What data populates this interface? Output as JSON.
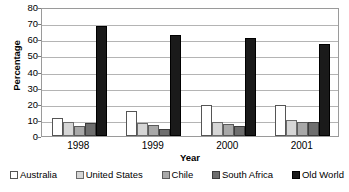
{
  "chart_data": {
    "type": "bar",
    "title": "",
    "subtitle": "",
    "xlabel": "Year",
    "ylabel": "Percentage",
    "categories": [
      "1998",
      "1999",
      "2000",
      "2001"
    ],
    "series": [
      {
        "name": "Australia",
        "color": "#ffffff",
        "values": [
          11,
          15.5,
          19,
          19.5
        ]
      },
      {
        "name": "United States",
        "color": "#d6d6d6",
        "values": [
          8.5,
          8,
          9,
          10
        ]
      },
      {
        "name": "Chile",
        "color": "#a8a8a8",
        "values": [
          6,
          7,
          7.5,
          9
        ]
      },
      {
        "name": "South Africa",
        "color": "#6e6e6e",
        "values": [
          8,
          4.5,
          6.5,
          8.5
        ]
      },
      {
        "name": "Old World",
        "color": "#1a1a1a",
        "values": [
          68,
          62.5,
          61,
          57
        ]
      }
    ],
    "ylim": [
      0,
      80
    ],
    "ytick_values": [
      0,
      10,
      20,
      30,
      40,
      50,
      60,
      70,
      80
    ],
    "ytick_labels": [
      "0",
      "10",
      "20",
      "30",
      "40",
      "50",
      "60",
      "70",
      "80"
    ],
    "grid": true,
    "legend_position": "bottom"
  }
}
